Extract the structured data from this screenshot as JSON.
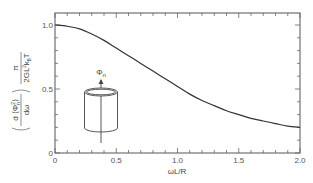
{
  "chart_data": {
    "type": "line",
    "title": "",
    "xlabel": "ωL/R",
    "ylabel": "(d⟨Φn²⟩/dω) · π/(2GL²k_BT)",
    "ylabel_parts": {
      "left_num": "d ⟨Φ",
      "left_sup": "2",
      "left_sub": "n",
      "left_close": "⟩",
      "left_den": "dω",
      "right_num": "π",
      "right_den": "2GL",
      "right_den_sup": "2",
      "right_den_tail": "k",
      "right_den_sub": "B",
      "right_den_end": "T"
    },
    "xlim": [
      0,
      2.0
    ],
    "ylim": [
      0,
      1.09
    ],
    "x_ticks": [
      "0",
      "0.5",
      "1.0",
      "1.5",
      "2.0"
    ],
    "y_ticks": [
      "0",
      "0.5",
      "1.0"
    ],
    "grid": false,
    "series": [
      {
        "name": "spectral density",
        "x": [
          0,
          0.1,
          0.2,
          0.3,
          0.4,
          0.5,
          0.6,
          0.7,
          0.8,
          0.9,
          1.0,
          1.1,
          1.2,
          1.3,
          1.4,
          1.5,
          1.6,
          1.7,
          1.8,
          1.9,
          2.0
        ],
        "y": [
          1.0,
          0.99,
          0.97,
          0.93,
          0.88,
          0.82,
          0.76,
          0.7,
          0.64,
          0.58,
          0.52,
          0.46,
          0.41,
          0.37,
          0.33,
          0.3,
          0.27,
          0.25,
          0.23,
          0.21,
          0.2
        ]
      }
    ],
    "annotations": [
      {
        "text": "Φ",
        "sub": "n",
        "description": "cylinder inset with axial flux arrow"
      }
    ]
  },
  "inset": {
    "label": "Φ",
    "label_sub": "n"
  }
}
